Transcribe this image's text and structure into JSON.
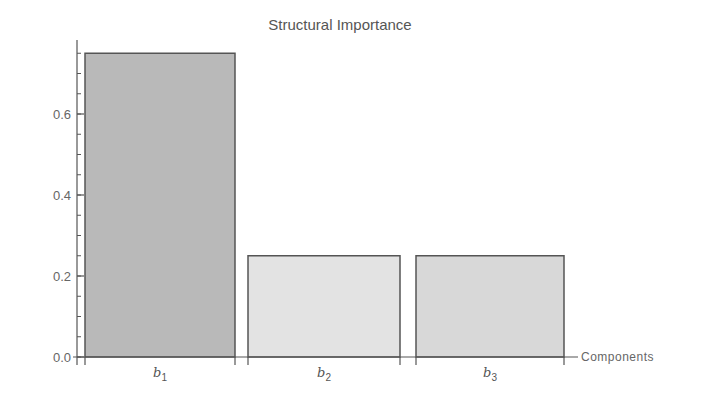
{
  "chart_data": {
    "type": "bar",
    "title": "Structural Importance",
    "xlabel": "Components",
    "ylabel": "",
    "categories": [
      "b1",
      "b2",
      "b3"
    ],
    "category_display": [
      {
        "base": "b",
        "sub": "1"
      },
      {
        "base": "b",
        "sub": "2"
      },
      {
        "base": "b",
        "sub": "3"
      }
    ],
    "values": [
      0.75,
      0.25,
      0.25
    ],
    "bar_colors": [
      "#b9b9b9",
      "#e3e3e3",
      "#d8d8d8"
    ],
    "edge_color": "#555555",
    "ylim": [
      0,
      0.78
    ],
    "yticks": [
      0.0,
      0.2,
      0.4,
      0.6
    ],
    "ytick_labels": [
      "0.0",
      "0.2",
      "0.4",
      "0.6"
    ],
    "minor_tick_step": 0.05,
    "grid": false,
    "legend": null
  }
}
